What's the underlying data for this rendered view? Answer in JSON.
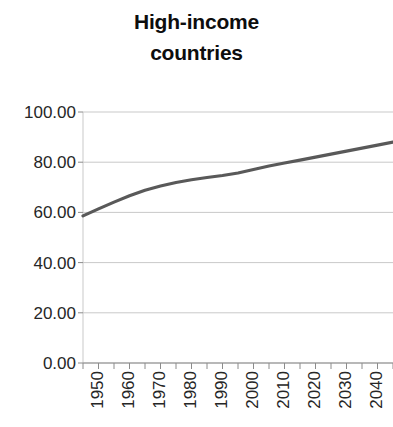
{
  "chart_data": {
    "type": "line",
    "title": "High-income countries",
    "title_lines": [
      "High-income",
      "countries"
    ],
    "xlabel": "",
    "ylabel": "",
    "xlim": [
      1950,
      2050
    ],
    "ylim": [
      0.0,
      100.0
    ],
    "grid": true,
    "grid_axis": "y",
    "legend": null,
    "legend_position": "none",
    "line_color": "#595959",
    "line_width": 3.2,
    "x_tick_labels": [
      "1950",
      "1960",
      "1970",
      "1980",
      "1990",
      "2000",
      "2010",
      "2020",
      "2030",
      "2040",
      "2050"
    ],
    "x_tick_values": [
      1950,
      1960,
      1970,
      1980,
      1990,
      2000,
      2010,
      2020,
      2030,
      2040,
      2050
    ],
    "x_minor_tick_interval": 5,
    "y_tick_labels": [
      "0.00",
      "20.00",
      "40.00",
      "60.00",
      "80.00",
      "100.00"
    ],
    "y_tick_values": [
      0,
      20,
      40,
      60,
      80,
      100
    ],
    "series": [
      {
        "name": "High-income countries",
        "x": [
          1950,
          1955,
          1960,
          1965,
          1970,
          1975,
          1980,
          1985,
          1990,
          1995,
          2000,
          2005,
          2010,
          2015,
          2020,
          2025,
          2030,
          2035,
          2040,
          2045,
          2050
        ],
        "values": [
          58.6,
          61.4,
          64.1,
          66.6,
          68.8,
          70.5,
          71.9,
          73.0,
          73.9,
          74.7,
          75.7,
          77.1,
          78.5,
          79.7,
          80.8,
          82.0,
          83.2,
          84.4,
          85.6,
          86.8,
          88.0
        ]
      }
    ]
  }
}
